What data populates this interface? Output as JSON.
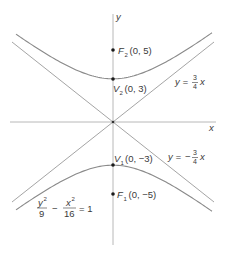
{
  "diagram": {
    "type": "hyperbola",
    "equation": {
      "num1": "y",
      "exp1": "2",
      "den1": "9",
      "minus": "−",
      "num2": "x",
      "exp2": "2",
      "den2": "16",
      "rhs": "= 1"
    },
    "axes": {
      "x_label": "x",
      "y_label": "y"
    },
    "points": [
      {
        "name": "F",
        "sub": "2",
        "coords": "(0, 5)",
        "x": 0,
        "y": 5
      },
      {
        "name": "V",
        "sub": "2",
        "coords": "(0, 3)",
        "x": 0,
        "y": 3
      },
      {
        "name": "V",
        "sub": "1",
        "coords": "(0, −3)",
        "x": 0,
        "y": -3
      },
      {
        "name": "F",
        "sub": "1",
        "coords": "(0, −5)",
        "x": 0,
        "y": -5
      }
    ],
    "asymptotes": [
      {
        "lhs": "y =",
        "sign": "",
        "num": "3",
        "den": "4",
        "var": "x",
        "slope": 0.75
      },
      {
        "lhs": "y =",
        "sign": "−",
        "num": "3",
        "den": "4",
        "var": "x",
        "slope": -0.75
      }
    ],
    "colors": {
      "curve": "#8c8c8c",
      "axis": "#b5b5b5",
      "asymptote": "#9a9a9a",
      "point": "#1a1a1a",
      "text": "#3a3a3a"
    }
  }
}
